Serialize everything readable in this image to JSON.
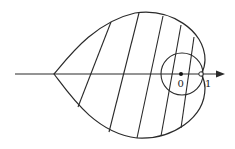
{
  "diagram": {
    "labels": {
      "origin": "0",
      "one": "1"
    },
    "colors": {
      "stroke": "#2a2a2a",
      "background": "#ffffff"
    },
    "elements": [
      "horizontal-axis-arrow",
      "cardioid-curve",
      "circle-around-origin",
      "hatch-lines",
      "origin-point",
      "point-at-one"
    ]
  }
}
